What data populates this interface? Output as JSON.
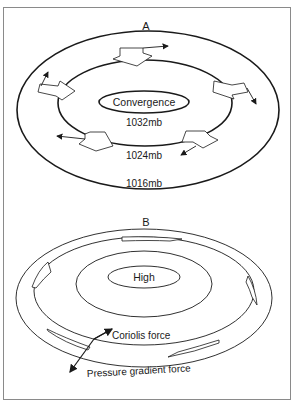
{
  "panel_a": {
    "label": "A",
    "center_label": "Convergence",
    "isobars": [
      {
        "label": "1032mb"
      },
      {
        "label": "1024mb"
      },
      {
        "label": "1016mb"
      }
    ]
  },
  "panel_b": {
    "label": "B",
    "center_label": "High",
    "forces": {
      "coriolis": "Coriolis force",
      "pressure_gradient": "Pressure gradient force"
    }
  },
  "colors": {
    "line": "#1a1a1a",
    "frame": "#8a8a8a",
    "background": "#ffffff"
  }
}
